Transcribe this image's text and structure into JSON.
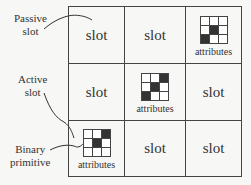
{
  "diagram": {
    "grid": {
      "rows": 3,
      "cols": 3,
      "cells": [
        {
          "row": 0,
          "col": 0,
          "type": "slot",
          "label": "slot"
        },
        {
          "row": 0,
          "col": 1,
          "type": "slot",
          "label": "slot"
        },
        {
          "row": 0,
          "col": 2,
          "type": "attributes",
          "label": "attributes",
          "pattern": [
            0,
            0,
            0,
            0,
            1,
            0,
            1,
            0,
            0
          ]
        },
        {
          "row": 1,
          "col": 0,
          "type": "slot",
          "label": "slot"
        },
        {
          "row": 1,
          "col": 1,
          "type": "attributes",
          "label": "attributes",
          "pattern": [
            0,
            0,
            1,
            0,
            1,
            0,
            1,
            0,
            0
          ]
        },
        {
          "row": 1,
          "col": 2,
          "type": "slot",
          "label": "slot"
        },
        {
          "row": 2,
          "col": 0,
          "type": "attributes",
          "label": "attributes",
          "pattern": [
            0,
            0,
            1,
            0,
            1,
            0,
            0,
            0,
            0
          ]
        },
        {
          "row": 2,
          "col": 1,
          "type": "slot",
          "label": "slot"
        },
        {
          "row": 2,
          "col": 2,
          "type": "slot",
          "label": "slot"
        }
      ]
    },
    "callouts": {
      "passive": {
        "line1": "Passive",
        "line2": "slot"
      },
      "active": {
        "line1": "Active",
        "line2": "slot"
      },
      "binary": {
        "line1": "Binary",
        "line2": "primitive"
      }
    },
    "colors": {
      "line": "#444444",
      "fill_on": "#333333",
      "fill_off": "#ffffff",
      "background": "#f7f7f5"
    }
  }
}
